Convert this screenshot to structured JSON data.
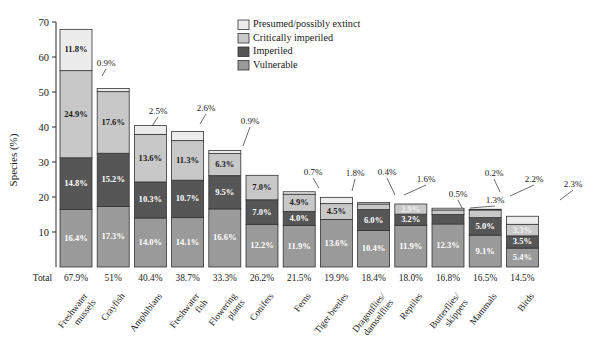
{
  "chart_data": {
    "type": "bar",
    "subtype": "stacked-bar",
    "title": "",
    "xlabel": "",
    "ylabel": "Species (%)",
    "ylim": [
      0,
      70
    ],
    "yticks": [
      10,
      20,
      30,
      40,
      50,
      60,
      70
    ],
    "ytick_labels": [
      "10",
      "20",
      "30",
      "40",
      "50",
      "60",
      "70"
    ],
    "grid": false,
    "legend_position": "top-right",
    "categories": [
      "Freshwater mussels",
      "Crayfish",
      "Amphibians",
      "Freshwater fish",
      "Flowering plants",
      "Conifers",
      "Ferns",
      "Tiger beetles",
      "Dragonflies/ damselflies",
      "Reptiles",
      "Butterflies/ skippers",
      "Mammals",
      "Birds"
    ],
    "category_lines": [
      [
        "Freshwater",
        "mussels"
      ],
      [
        "Crayfish"
      ],
      [
        "Amphibians"
      ],
      [
        "Freshwater",
        "fish"
      ],
      [
        "Flowering",
        "plants"
      ],
      [
        "Conifers"
      ],
      [
        "Ferns"
      ],
      [
        "Tiger beetles"
      ],
      [
        "Dragonflies/",
        "damselflies"
      ],
      [
        "Reptiles"
      ],
      [
        "Butterflies/",
        "skippers"
      ],
      [
        "Mammals"
      ],
      [
        "Birds"
      ]
    ],
    "series": [
      {
        "name": "Vulnerable",
        "color": "#9a9a9a",
        "values": [
          16.4,
          17.3,
          14.0,
          14.1,
          16.6,
          12.2,
          11.9,
          13.6,
          10.4,
          11.9,
          12.3,
          9.1,
          5.4
        ],
        "labels": [
          "16.4%",
          "17.3%",
          "14.0%",
          "14.1%",
          "16.6%",
          "12.2%",
          "11.9%",
          "13.6%",
          "10.4%",
          "11.9%",
          "12.3%",
          "9.1%",
          "5.4%"
        ]
      },
      {
        "name": "Imperiled",
        "color": "#565656",
        "values": [
          14.8,
          15.2,
          10.3,
          10.7,
          9.5,
          7.0,
          4.0,
          0.0,
          6.0,
          3.2,
          2.7,
          5.0,
          3.5
        ],
        "labels": [
          "14.8%",
          "15.2%",
          "10.3%",
          "10.7%",
          "9.5%",
          "7.0%",
          "4.0%",
          "",
          "6.0%",
          "3.2%",
          "2.7%",
          "5.0%",
          "3.5%"
        ]
      },
      {
        "name": "Critically imperiled",
        "color": "#c8c8c8",
        "values": [
          24.9,
          17.6,
          13.6,
          11.3,
          6.3,
          7.0,
          4.9,
          4.5,
          1.6,
          2.9,
          1.3,
          2.2,
          3.3
        ],
        "labels": [
          "24.9%",
          "17.6%",
          "13.6%",
          "11.3%",
          "6.3%",
          "7.0%",
          "4.9%",
          "4.5%",
          "1.6%",
          "2.9%",
          "1.3%",
          "2.2%",
          "3.3%"
        ]
      },
      {
        "name": "Presumed/possibly extinct",
        "color": "#ececec",
        "values": [
          11.8,
          0.9,
          2.5,
          2.6,
          0.9,
          0.0,
          0.7,
          1.8,
          0.4,
          0.0,
          0.5,
          0.2,
          2.3
        ],
        "labels": [
          "11.8%",
          "0.9%",
          "2.5%",
          "2.6%",
          "0.9%",
          "",
          "0.7%",
          "1.8%",
          "0.4%",
          "",
          "0.5%",
          "0.2%",
          "2.3%"
        ]
      }
    ],
    "totals": [
      67.9,
      51.0,
      40.4,
      38.7,
      33.3,
      26.2,
      21.5,
      19.9,
      18.4,
      18.0,
      16.8,
      16.5,
      14.5
    ],
    "total_labels": [
      "67.9%",
      "51%",
      "40.4%",
      "38.7%",
      "33.3%",
      "26.2%",
      "21.5%",
      "19.9%",
      "18.4%",
      "18.0%",
      "16.8%",
      "16.5%",
      "14.5%"
    ],
    "total_row_title": "Total",
    "legend": [
      {
        "label": "Presumed/possibly extinct",
        "color": "#ececec"
      },
      {
        "label": "Critically imperiled",
        "color": "#c8c8c8"
      },
      {
        "label": "Imperiled",
        "color": "#565656"
      },
      {
        "label": "Vulnerable",
        "color": "#9a9a9a"
      }
    ],
    "colors": {
      "extinct": "#ececec",
      "critically_imperiled": "#c8c8c8",
      "imperiled": "#565656",
      "vulnerable": "#9a9a9a",
      "axis": "#2a2a2a",
      "text": "#1a1a1a"
    }
  }
}
